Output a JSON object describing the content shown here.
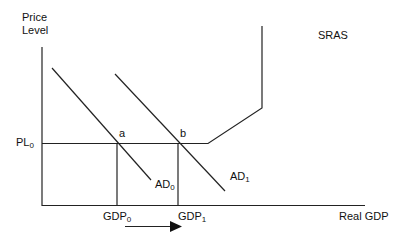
{
  "diagram": {
    "y_axis_label_line1": "Price",
    "y_axis_label_line2": "Level",
    "x_axis_label": "Real GDP",
    "price_level_label": "PL",
    "price_level_sub": "0",
    "sras_label": "SRAS",
    "ad0_label": "AD",
    "ad0_sub": "0",
    "ad1_label": "AD",
    "ad1_sub": "1",
    "point_a": "a",
    "point_b": "b",
    "gdp0_label": "GDP",
    "gdp0_sub": "0",
    "gdp1_label": "GDP",
    "gdp1_sub": "1",
    "line_color": "#222222"
  }
}
